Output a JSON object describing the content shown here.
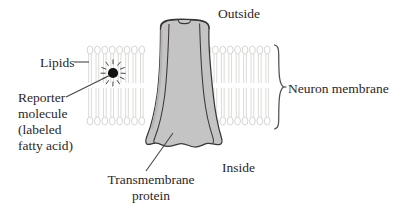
{
  "figure": {
    "title_alt": "Neuron membrane with transmembrane protein and labeled fatty acid reporter molecule",
    "labels": {
      "outside": "Outside",
      "inside": "Inside",
      "neuron_membrane": "Neuron membrane",
      "lipids": "Lipids",
      "reporter_line1": "Reporter",
      "reporter_line2": "molecule",
      "reporter_line3": "(labeled",
      "reporter_line4": "fatty acid)",
      "transmembrane_line1": "Transmembrane",
      "transmembrane_line2": "protein"
    },
    "colors": {
      "background": "#ffffff",
      "text": "#2b2726",
      "lipid_outline": "#d0cecb",
      "protein_fill": "#c4c4c4",
      "protein_outline": "#3a3634",
      "reporter_dot": "#111111",
      "leader_line": "#4a4644",
      "brace": "#54504e"
    },
    "structure": {
      "bilayer_left_x_range": [
        88,
        142
      ],
      "bilayer_right_x_range": [
        206,
        272
      ],
      "bilayer_top_heads_y": 49,
      "bilayer_bottom_heads_y": 122,
      "lipid_head_width": 6,
      "lipid_head_height": 8,
      "lipid_spacing": 7.4,
      "reporter_dot_center": [
        113,
        73
      ],
      "reporter_dot_radius": 5,
      "brace_x": 276,
      "brace_y_range": [
        45,
        129
      ],
      "protein_top_y": 20,
      "protein_bottom_y": 148
    }
  }
}
